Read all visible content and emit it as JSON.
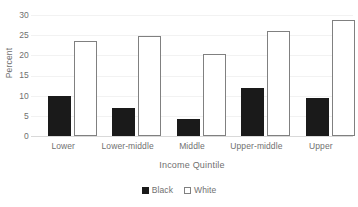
{
  "chart_data": {
    "type": "bar",
    "title": "",
    "xlabel": "Income Quintile",
    "ylabel": "Percent",
    "categories": [
      "Lower",
      "Lower-middle",
      "Middle",
      "Upper-middle",
      "Upper"
    ],
    "series": [
      {
        "name": "Black",
        "color": "#1a1a1a",
        "values": [
          10.0,
          7.0,
          4.2,
          11.9,
          9.4
        ]
      },
      {
        "name": "White",
        "color": "#ffffff",
        "values": [
          23.5,
          24.8,
          20.3,
          26.0,
          28.8
        ]
      }
    ],
    "ylim": [
      0,
      30
    ],
    "yticks": [
      0,
      5,
      10,
      15,
      20,
      25,
      30
    ],
    "ytick_labels": [
      "0",
      "5",
      "10",
      "15",
      "20",
      "25",
      "30"
    ],
    "grid": true,
    "legend_position": "bottom"
  },
  "axes": {
    "y_title": "Percent",
    "x_title": "Income Quintile",
    "y_ticks": [
      "30",
      "25",
      "20",
      "15",
      "10",
      "5",
      "0"
    ]
  },
  "legend": {
    "items": [
      {
        "label": "Black",
        "style": "filled"
      },
      {
        "label": "White",
        "style": "outline"
      }
    ]
  }
}
